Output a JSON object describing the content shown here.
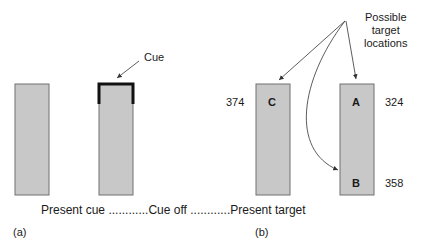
{
  "panel_a": {
    "label": "(a)",
    "cue_label": "Cue"
  },
  "panel_b": {
    "label": "(b)",
    "possible_targets_label_line1": "Possible",
    "possible_targets_label_line2": "target",
    "possible_targets_label_line3": "locations",
    "boxes": [
      {
        "letter": "C",
        "value": "374"
      },
      {
        "letter": "A",
        "value": "324"
      },
      {
        "letter": "B",
        "value": "358"
      }
    ]
  },
  "timeline": {
    "step1": "Present cue",
    "dots1": "............",
    "step2": "Cue off",
    "dots2": "............",
    "step3": "Present target"
  },
  "colors": {
    "box_fill": "#c8c8c8",
    "box_stroke": "#707070",
    "cue": "#111111",
    "arrow": "#333333"
  }
}
